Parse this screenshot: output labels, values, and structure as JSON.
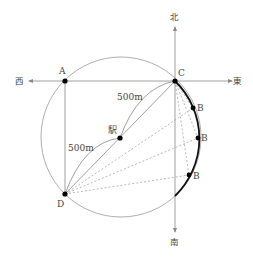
{
  "diagram": {
    "directions": {
      "north": "北",
      "south": "南",
      "west": "西",
      "east": "東"
    },
    "points": {
      "A": "A",
      "C": "C",
      "D": "D",
      "B1": "B",
      "B2": "B",
      "B3": "B",
      "station": "駅"
    },
    "distances": {
      "station_to_C": "500m",
      "D_to_station": "500m"
    },
    "colors": {
      "line": "#888888",
      "thick_arc": "#111111",
      "point": "#000000"
    }
  }
}
